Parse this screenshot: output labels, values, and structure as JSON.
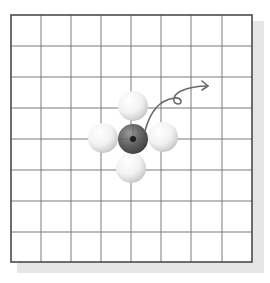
{
  "diagram": {
    "type": "grid-with-spheres",
    "grid": {
      "columns": 8,
      "rows": 8,
      "line_color": "#6e6e6e",
      "border_color": "#4a4a4a",
      "background": "#ffffff",
      "shadow_color": "#e3e3e3"
    },
    "spheres": [
      {
        "role": "center",
        "color": "dark",
        "col": 4,
        "row": 4
      },
      {
        "role": "neighbor-top",
        "color": "white",
        "col": 4,
        "row": 3
      },
      {
        "role": "neighbor-left",
        "color": "white",
        "col": 3,
        "row": 4
      },
      {
        "role": "neighbor-right",
        "color": "white",
        "col": 5,
        "row": 4
      },
      {
        "role": "neighbor-bottom",
        "color": "white",
        "col": 4,
        "row": 5
      }
    ],
    "arrow": {
      "description": "curved looping arrow from center sphere toward upper right",
      "color": "#6a6a6a"
    }
  }
}
